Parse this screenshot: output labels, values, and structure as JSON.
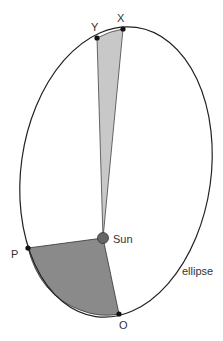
{
  "diagram": {
    "type": "kepler-second-law",
    "orbit_label": "ellipse",
    "star_label": "Sun",
    "points": {
      "X": {
        "label": "X"
      },
      "Y": {
        "label": "Y"
      },
      "P": {
        "label": "P"
      },
      "O": {
        "label": "O"
      }
    },
    "colors": {
      "orbit_stroke": "#222222",
      "sector_light": "#c8c8c8",
      "sector_dark": "#8a8a8a",
      "sun_fill": "#666666",
      "point_fill": "#111111"
    }
  }
}
